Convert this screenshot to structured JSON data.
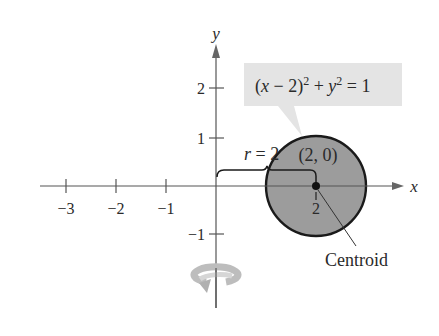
{
  "diagram": {
    "axes": {
      "x_label": "x",
      "y_label": "y",
      "x_ticks": [
        {
          "value": -3,
          "label": "−3"
        },
        {
          "value": -2,
          "label": "−2"
        },
        {
          "value": -1,
          "label": "−1"
        },
        {
          "value": 2,
          "label": "2"
        }
      ],
      "y_ticks": [
        {
          "value": 2,
          "label": "2"
        },
        {
          "value": 1,
          "label": "1"
        },
        {
          "value": -1,
          "label": "−1"
        }
      ]
    },
    "region": {
      "shape": "circle",
      "center": [
        2,
        0
      ],
      "radius": 1,
      "fill_color": "#9c9c9c",
      "stroke_color": "#1a1a1a"
    },
    "callout": {
      "equation": "(x − 2)² + y² = 1",
      "eq_parts": {
        "open": "(",
        "x": "x",
        "minus": " − 2)",
        "sq1": "2",
        "plus": " + ",
        "y": "y",
        "sq2": "2",
        "eq": " = 1"
      },
      "background": "#e4e4e4"
    },
    "annotations": {
      "radius_label_r": "r",
      "radius_label_rest": " = 2",
      "center_label": "(2, 0)",
      "centroid_label": "Centroid",
      "axis_of_revolution": "y-axis",
      "rotation_icon_color": "#b8b8b8"
    }
  }
}
